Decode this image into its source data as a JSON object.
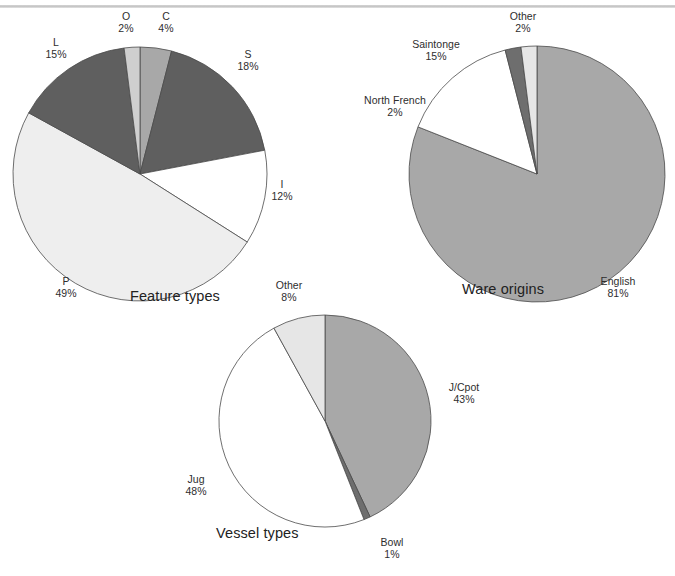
{
  "page": {
    "background_color": "#ffffff",
    "rule_color": "#c9c9c9",
    "text_color": "#2b2b2b"
  },
  "palette": {
    "white": "#ffffff",
    "very_light_gray": "#eeeeee",
    "light_gray": "#d9d9d9",
    "medium_gray": "#a8a8a8",
    "dark_gray": "#6e6e6e",
    "darker_gray": "#555555",
    "outline": "#4a4a4a"
  },
  "charts": [
    {
      "id": "feature-types",
      "title": "Feature types",
      "type": "pie",
      "start_angle": 0,
      "direction": "clockwise",
      "slices": [
        {
          "label": "C",
          "pct_text": "4%",
          "value": 4,
          "color": "#a8a8a8",
          "label_x": 164,
          "label_y": 16,
          "align": "center"
        },
        {
          "label": "S",
          "pct_text": "18%",
          "value": 18,
          "color": "#5f5f5f",
          "label_x": 247,
          "label_y": 52,
          "align": "center"
        },
        {
          "label": "I",
          "pct_text": "12%",
          "value": 12,
          "color": "#ffffff",
          "label_x": 281,
          "label_y": 182,
          "align": "center"
        },
        {
          "label": "P",
          "pct_text": "49%",
          "value": 49,
          "color": "#eeeeee",
          "label_x": 66,
          "label_y": 280,
          "align": "center"
        },
        {
          "label": "L",
          "pct_text": "15%",
          "value": 15,
          "color": "#5f5f5f",
          "label_x": 55,
          "label_y": 40,
          "align": "center"
        },
        {
          "label": "O",
          "pct_text": "2%",
          "value": 2,
          "color": "#cfcfcf",
          "label_x": 122,
          "label_y": 16,
          "align": "center"
        }
      ]
    },
    {
      "id": "ware-origins",
      "title": "Ware origins",
      "type": "pie",
      "start_angle": 0,
      "direction": "clockwise",
      "slices": [
        {
          "label": "English",
          "pct_text": "81%",
          "value": 81,
          "color": "#a8a8a8",
          "label_x": 620,
          "label_y": 281,
          "align": "center"
        },
        {
          "label": "Saintonge",
          "pct_text": "15%",
          "value": 15,
          "color": "#ffffff",
          "label_x": 436,
          "label_y": 44,
          "align": "center"
        },
        {
          "label": "North French",
          "pct_text": "2%",
          "value": 2,
          "color": "#6e6e6e",
          "label_x": 396,
          "label_y": 100,
          "align": "center"
        },
        {
          "label": "Other",
          "pct_text": "2%",
          "value": 2,
          "color": "#e6e6e6",
          "label_x": 523,
          "label_y": 16,
          "align": "center"
        }
      ]
    },
    {
      "id": "vessel-types",
      "title": "Vessel types",
      "type": "pie",
      "start_angle": 0,
      "direction": "clockwise",
      "slices": [
        {
          "label": "J/Cpot",
          "pct_text": "43%",
          "value": 43,
          "color": "#a8a8a8",
          "label_x": 464,
          "label_y": 385,
          "align": "center"
        },
        {
          "label": "Bowl",
          "pct_text": "1%",
          "value": 1,
          "color": "#6e6e6e",
          "label_x": 392,
          "label_y": 540,
          "align": "center"
        },
        {
          "label": "Jug",
          "pct_text": "48%",
          "value": 48,
          "color": "#ffffff",
          "label_x": 196,
          "label_y": 478,
          "align": "center"
        },
        {
          "label": "Other",
          "pct_text": "8%",
          "value": 8,
          "color": "#e6e6e6",
          "label_x": 289,
          "label_y": 284,
          "align": "center"
        }
      ]
    }
  ],
  "chart_data": [
    {
      "type": "pie",
      "title": "Feature types",
      "categories": [
        "C",
        "S",
        "I",
        "P",
        "L",
        "O"
      ],
      "values": [
        4,
        18,
        12,
        49,
        15,
        2
      ],
      "labels": [
        "C 4%",
        "S 18%",
        "I 12%",
        "P 49%",
        "L 15%",
        "O 2%"
      ],
      "unit": "percent",
      "legend": "none",
      "data_labels": true,
      "slice_colors": [
        "#a8a8a8",
        "#5f5f5f",
        "#ffffff",
        "#eeeeee",
        "#5f5f5f",
        "#cfcfcf"
      ],
      "start_angle_deg": 0,
      "direction": "clockwise"
    },
    {
      "type": "pie",
      "title": "Ware origins",
      "categories": [
        "English",
        "Saintonge",
        "North French",
        "Other"
      ],
      "values": [
        81,
        15,
        2,
        2
      ],
      "labels": [
        "English 81%",
        "Saintonge 15%",
        "North French 2%",
        "Other 2%"
      ],
      "unit": "percent",
      "legend": "none",
      "data_labels": true,
      "slice_colors": [
        "#a8a8a8",
        "#ffffff",
        "#6e6e6e",
        "#e6e6e6"
      ],
      "start_angle_deg": 0,
      "direction": "clockwise"
    },
    {
      "type": "pie",
      "title": "Vessel types",
      "categories": [
        "J/Cpot",
        "Bowl",
        "Jug",
        "Other"
      ],
      "values": [
        43,
        1,
        48,
        8
      ],
      "labels": [
        "J/Cpot 43%",
        "Bowl 1%",
        "Jug 48%",
        "Other 8%"
      ],
      "unit": "percent",
      "legend": "none",
      "data_labels": true,
      "slice_colors": [
        "#a8a8a8",
        "#6e6e6e",
        "#ffffff",
        "#e6e6e6"
      ],
      "start_angle_deg": 0,
      "direction": "clockwise"
    }
  ],
  "geometry": {
    "pie1": {
      "cx": 140,
      "cy": 174,
      "r": 127
    },
    "pie2": {
      "cx": 537,
      "cy": 174,
      "r": 128
    },
    "pie3": {
      "cx": 325,
      "cy": 421,
      "r": 106
    }
  },
  "captions": {
    "feature_types": {
      "text": "Feature types",
      "x": 130,
      "y": 295
    },
    "ware_origins": {
      "text": "Ware origins",
      "x": 462,
      "y": 288
    },
    "vessel_types": {
      "text": "Vessel types",
      "x": 216,
      "y": 533
    }
  }
}
